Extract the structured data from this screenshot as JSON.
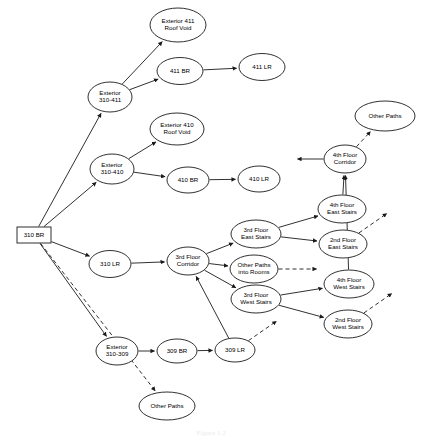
{
  "figure": {
    "caption": "Figure 1.2"
  },
  "graph": {
    "node_shapes": {
      "source": "rectangle",
      "default": "ellipse"
    },
    "edge_styles": {
      "solid": "known path",
      "dashed": "other / unspecified path"
    },
    "nodes": [
      {
        "id": "310-br",
        "label": "310 BR",
        "lines": [
          "310 BR"
        ],
        "shape": "rect",
        "cx": 34,
        "cy": 235,
        "rx": 17,
        "ry": 8
      },
      {
        "id": "ext-411-roof-void",
        "label": "Exterior 411 Roof Void",
        "lines": [
          "Exterior 411",
          "Roof Void"
        ],
        "shape": "ellipse",
        "cx": 178,
        "cy": 25,
        "rx": 28,
        "ry": 17
      },
      {
        "id": "411-br",
        "label": "411 BR",
        "lines": [
          "411 BR"
        ],
        "shape": "ellipse",
        "cx": 180,
        "cy": 71,
        "rx": 23,
        "ry": 13.5
      },
      {
        "id": "411-lr",
        "label": "411 LR",
        "lines": [
          "411 LR"
        ],
        "shape": "ellipse",
        "cx": 262,
        "cy": 67,
        "rx": 23,
        "ry": 13.5
      },
      {
        "id": "ext-310-411",
        "label": "Exterior 310-411",
        "lines": [
          "Exterior",
          "310-411"
        ],
        "shape": "ellipse",
        "cx": 110,
        "cy": 97,
        "rx": 22,
        "ry": 15
      },
      {
        "id": "ext-410-roof-void",
        "label": "Exterior 410 Roof Void",
        "lines": [
          "Exterior 410",
          "Roof Void"
        ],
        "shape": "ellipse",
        "cx": 177,
        "cy": 129,
        "rx": 27,
        "ry": 16
      },
      {
        "id": "ext-310-410",
        "label": "Exterior 310-410",
        "lines": [
          "Exterior",
          "310-410"
        ],
        "shape": "ellipse",
        "cx": 112,
        "cy": 169,
        "rx": 22,
        "ry": 15
      },
      {
        "id": "410-br",
        "label": "410 BR",
        "lines": [
          "410 BR"
        ],
        "shape": "ellipse",
        "cx": 188,
        "cy": 180,
        "rx": 21,
        "ry": 13
      },
      {
        "id": "410-lr",
        "label": "410 LR",
        "lines": [
          "410 LR"
        ],
        "shape": "ellipse",
        "cx": 259,
        "cy": 179,
        "rx": 21,
        "ry": 13
      },
      {
        "id": "310-lr",
        "label": "310 LR",
        "lines": [
          "310 LR"
        ],
        "shape": "ellipse",
        "cx": 110,
        "cy": 264,
        "rx": 21,
        "ry": 13.5
      },
      {
        "id": "3rd-floor-corridor",
        "label": "3rd Floor Corridor",
        "lines": [
          "3rd Floor",
          "Corridor"
        ],
        "shape": "ellipse",
        "cx": 188,
        "cy": 261,
        "rx": 21,
        "ry": 14
      },
      {
        "id": "3rd-floor-east-stairs",
        "label": "3rd Floor East Stairs",
        "lines": [
          "3rd Floor",
          "East Stairs"
        ],
        "shape": "ellipse",
        "cx": 256,
        "cy": 234,
        "rx": 25,
        "ry": 14
      },
      {
        "id": "other-paths-into-rooms",
        "label": "Other Paths into Rooms",
        "lines": [
          "Other Paths",
          "into Rooms"
        ],
        "shape": "ellipse",
        "cx": 254,
        "cy": 269,
        "rx": 24,
        "ry": 14
      },
      {
        "id": "3rd-floor-west-stairs",
        "label": "3rd Floor West Stairs",
        "lines": [
          "3rd Floor",
          "West Stairs"
        ],
        "shape": "ellipse",
        "cx": 256,
        "cy": 299,
        "rx": 25,
        "ry": 14
      },
      {
        "id": "4th-floor-east-stairs",
        "label": "4th Floor East Stairs",
        "lines": [
          "4th Floor",
          "East Stairs"
        ],
        "shape": "ellipse",
        "cx": 342,
        "cy": 209,
        "rx": 24,
        "ry": 14
      },
      {
        "id": "2nd-floor-east-stairs",
        "label": "2nd Floor East Stairs",
        "lines": [
          "2nd Floor",
          "East Stairs"
        ],
        "shape": "ellipse",
        "cx": 343,
        "cy": 244,
        "rx": 24,
        "ry": 14
      },
      {
        "id": "4th-floor-west-stairs",
        "label": "4th Floor West Stairs",
        "lines": [
          "4th Floor",
          "West Stairs"
        ],
        "shape": "ellipse",
        "cx": 349,
        "cy": 284,
        "rx": 25,
        "ry": 14
      },
      {
        "id": "2nd-floor-west-stairs",
        "label": "2nd Floor West Stairs",
        "lines": [
          "2nd Floor",
          "West Stairs"
        ],
        "shape": "ellipse",
        "cx": 348,
        "cy": 324,
        "rx": 24,
        "ry": 14
      },
      {
        "id": "4th-floor-corridor",
        "label": "4th Floor Corridor",
        "lines": [
          "4th Floor",
          "Corridor"
        ],
        "shape": "ellipse",
        "cx": 345,
        "cy": 159,
        "rx": 21,
        "ry": 14
      },
      {
        "id": "other-paths-top",
        "label": "Other Paths",
        "lines": [
          "Other Paths"
        ],
        "shape": "ellipse",
        "cx": 385,
        "cy": 116,
        "rx": 30,
        "ry": 15
      },
      {
        "id": "ext-310-309",
        "label": "Exterior 310-309",
        "lines": [
          "Exterior",
          "310-309"
        ],
        "shape": "ellipse",
        "cx": 117,
        "cy": 351,
        "rx": 21,
        "ry": 14
      },
      {
        "id": "309-br",
        "label": "309 BR",
        "lines": [
          "309 BR"
        ],
        "shape": "ellipse",
        "cx": 177,
        "cy": 351,
        "rx": 20,
        "ry": 12
      },
      {
        "id": "309-lr",
        "label": "309 LR",
        "lines": [
          "309 LR"
        ],
        "shape": "ellipse",
        "cx": 235,
        "cy": 350,
        "rx": 20,
        "ry": 12
      },
      {
        "id": "other-paths-bottom",
        "label": "Other Paths",
        "lines": [
          "Other Paths"
        ],
        "shape": "ellipse",
        "cx": 167,
        "cy": 406,
        "rx": 28,
        "ry": 14
      }
    ],
    "edges": [
      {
        "from": "310-br",
        "to": "ext-310-411",
        "style": "solid"
      },
      {
        "from": "310-br",
        "to": "ext-310-410",
        "style": "solid"
      },
      {
        "from": "310-br",
        "to": "310-lr",
        "style": "solid"
      },
      {
        "from": "310-br",
        "to": "ext-310-309",
        "style": "solid"
      },
      {
        "from": "310-br",
        "to": "other-paths-bottom",
        "style": "dashed"
      },
      {
        "from": "ext-310-411",
        "to": "ext-411-roof-void",
        "style": "solid"
      },
      {
        "from": "ext-310-411",
        "to": "411-br",
        "style": "solid"
      },
      {
        "from": "411-br",
        "to": "411-lr",
        "style": "solid"
      },
      {
        "from": "ext-310-410",
        "to": "ext-410-roof-void",
        "style": "solid"
      },
      {
        "from": "ext-310-410",
        "to": "410-br",
        "style": "solid"
      },
      {
        "from": "410-br",
        "to": "410-lr",
        "style": "solid"
      },
      {
        "from": "310-lr",
        "to": "3rd-floor-corridor",
        "style": "solid"
      },
      {
        "from": "3rd-floor-corridor",
        "to": "3rd-floor-east-stairs",
        "style": "solid"
      },
      {
        "from": "3rd-floor-corridor",
        "to": "other-paths-into-rooms",
        "style": "solid"
      },
      {
        "from": "3rd-floor-corridor",
        "to": "3rd-floor-west-stairs",
        "style": "solid"
      },
      {
        "from": "3rd-floor-east-stairs",
        "to": "4th-floor-east-stairs",
        "style": "solid"
      },
      {
        "from": "3rd-floor-east-stairs",
        "to": "2nd-floor-east-stairs",
        "style": "solid"
      },
      {
        "from": "3rd-floor-west-stairs",
        "to": "4th-floor-west-stairs",
        "style": "solid"
      },
      {
        "from": "3rd-floor-west-stairs",
        "to": "2nd-floor-west-stairs",
        "style": "solid"
      },
      {
        "from": "4th-floor-east-stairs",
        "to": "4th-floor-corridor",
        "style": "solid"
      },
      {
        "from": "4th-floor-west-stairs",
        "to": "4th-floor-corridor",
        "style": "solid"
      },
      {
        "from": "4th-floor-corridor",
        "to": "other-paths-top",
        "style": "dashed"
      },
      {
        "from": "ext-310-309",
        "to": "309-br",
        "style": "solid"
      },
      {
        "from": "309-br",
        "to": "309-lr",
        "style": "solid"
      },
      {
        "from": "309-lr",
        "to": "3rd-floor-corridor",
        "style": "solid"
      }
    ],
    "open_stubs": [
      {
        "id": "stub-corridor-left",
        "from": "4th-floor-corridor",
        "style": "solid",
        "direction": "left"
      },
      {
        "id": "stub-other-rooms",
        "from": "other-paths-into-rooms",
        "style": "dashed",
        "direction": "right"
      },
      {
        "id": "stub-309-lr",
        "from": "309-lr",
        "style": "dashed",
        "direction": "up-right"
      },
      {
        "id": "stub-2nd-east-stairs",
        "from": "2nd-floor-east-stairs",
        "style": "dashed",
        "direction": "up-right"
      },
      {
        "id": "stub-2nd-west-stairs",
        "from": "2nd-floor-west-stairs",
        "style": "dashed",
        "direction": "up-right"
      }
    ]
  }
}
